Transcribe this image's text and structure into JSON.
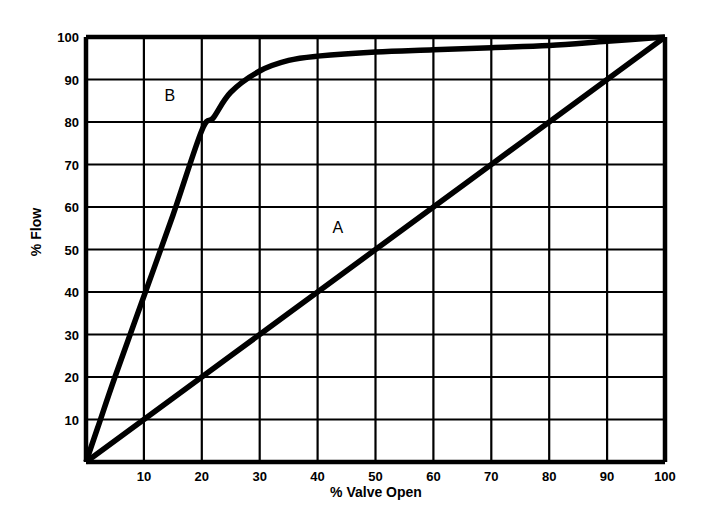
{
  "chart_data": {
    "type": "line",
    "title": "",
    "xlabel": "% Valve Open",
    "ylabel": "% Flow",
    "xlim": [
      0,
      100
    ],
    "ylim": [
      0,
      100
    ],
    "grid": true,
    "legend": "inline-annotations",
    "x_ticks": [
      10,
      20,
      30,
      40,
      50,
      60,
      70,
      80,
      90,
      100
    ],
    "y_ticks": [
      10,
      20,
      30,
      40,
      50,
      60,
      70,
      80,
      90,
      100
    ],
    "x_tick_labels": [
      "10",
      "20",
      "30",
      "40",
      "50",
      "60",
      "70",
      "80",
      "90",
      "100"
    ],
    "y_tick_labels": [
      "10",
      "20",
      "30",
      "40",
      "50",
      "60",
      "70",
      "80",
      "90",
      "100"
    ],
    "annotations": [
      {
        "text": "B",
        "x": 14.5,
        "y": 85
      },
      {
        "text": "A",
        "x": 43.5,
        "y": 54
      }
    ],
    "series": [
      {
        "name": "A",
        "label": "A",
        "description": "Linear valve characteristic",
        "color": "#000000",
        "x": [
          0,
          10,
          20,
          30,
          40,
          50,
          60,
          70,
          80,
          90,
          100
        ],
        "values": [
          0,
          10,
          20,
          30,
          40,
          50,
          60,
          70,
          80,
          90,
          100
        ]
      },
      {
        "name": "B",
        "label": "B",
        "description": "Quick-opening valve characteristic",
        "color": "#000000",
        "x": [
          0,
          2,
          5,
          10,
          15,
          20,
          22,
          25,
          30,
          35,
          40,
          50,
          60,
          70,
          80,
          90,
          100
        ],
        "values": [
          0,
          8,
          20,
          39,
          58,
          78,
          81,
          87,
          92,
          94.5,
          95.5,
          96.5,
          97,
          97.5,
          98,
          99,
          100
        ]
      }
    ]
  },
  "axis": {
    "x_title": "% Valve Open",
    "y_title": "% Flow"
  }
}
